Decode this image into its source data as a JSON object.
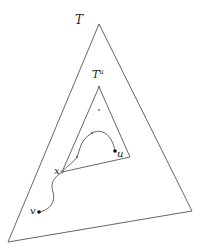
{
  "diagram": {
    "outer_triangle": {
      "label": "T",
      "points": [
        [
          99,
          24
        ],
        [
          8,
          242
        ],
        [
          192,
          211
        ]
      ]
    },
    "inner_triangle": {
      "label": "T",
      "label_sup": "u",
      "points": [
        [
          99,
          87
        ],
        [
          62,
          172
        ],
        [
          130,
          157
        ]
      ]
    },
    "nodes": {
      "x": {
        "label": "x",
        "pos": [
          62,
          172
        ]
      },
      "u": {
        "label": "u",
        "pos": [
          115,
          151
        ]
      },
      "v": {
        "label": "v",
        "pos": [
          39,
          212
        ]
      },
      "apex_inner": {
        "pos": [
          99,
          87
        ]
      },
      "interior_point": {
        "pos": [
          99,
          110
        ]
      },
      "path_mid1": {
        "pos": [
          77,
          157
        ]
      },
      "path_mid2": {
        "pos": [
          92,
          133
        ]
      }
    },
    "colors": {
      "line": "#555555",
      "node": "#111111",
      "text": "#222222"
    }
  }
}
